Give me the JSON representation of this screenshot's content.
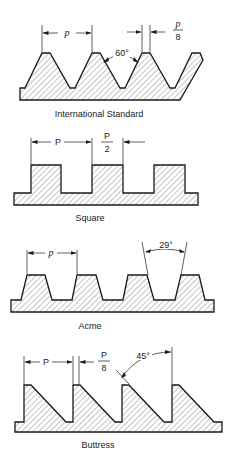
{
  "figure": {
    "panels": [
      {
        "name": "International Standard",
        "label": "International Standard",
        "dimensions": {
          "pitch": "p",
          "flat": "p",
          "flat_denominator": "8",
          "angle": "60°"
        }
      },
      {
        "name": "Square",
        "label": "Square",
        "dimensions": {
          "pitch": "P",
          "half": "P",
          "half_denominator": "2"
        }
      },
      {
        "name": "Acme",
        "label": "Acme",
        "dimensions": {
          "pitch": "p",
          "angle": "29°"
        }
      },
      {
        "name": "Buttress",
        "label": "Buttress",
        "dimensions": {
          "pitch": "P",
          "flat": "P",
          "flat_denominator": "8",
          "angle": "45°"
        }
      }
    ]
  }
}
